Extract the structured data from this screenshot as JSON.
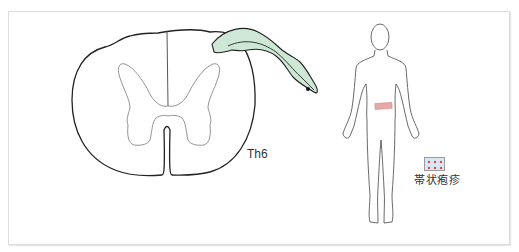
{
  "figure": {
    "segment_label": "Th6",
    "legend": {
      "label": "帯状疱疹",
      "swatch_fill": "#d9e7f3",
      "swatch_dot_color": "#d2504a"
    },
    "colors": {
      "outline": "#222222",
      "gray_matter": "#888888",
      "nerve_fill": "#cfe8d6",
      "dermatome_band": "#e7a8a8"
    }
  }
}
